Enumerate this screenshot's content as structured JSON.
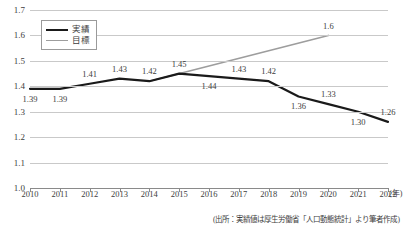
{
  "chart_data": {
    "type": "line",
    "title": "",
    "xlabel": "(年)",
    "ylabel": "",
    "x": [
      2010,
      2011,
      2012,
      2013,
      2014,
      2015,
      2016,
      2017,
      2018,
      2019,
      2020,
      2021,
      2022
    ],
    "categories": [
      "2010",
      "2011",
      "2012",
      "2013",
      "2014",
      "2015",
      "2016",
      "2017",
      "2018",
      "2019",
      "2020",
      "2021",
      "2022"
    ],
    "xlim": [
      2010,
      2022
    ],
    "ylim": [
      1.0,
      1.7
    ],
    "yticks": [
      "1.0",
      "1.1",
      "1.2",
      "1.3",
      "1.4",
      "1.5",
      "1.6",
      "1.7"
    ],
    "ytick_values": [
      1.0,
      1.1,
      1.2,
      1.3,
      1.4,
      1.5,
      1.6,
      1.7
    ],
    "grid": true,
    "legend_position": "upper-left",
    "series": [
      {
        "name": "実績",
        "color": "#1a1a1a",
        "x": [
          2010,
          2011,
          2012,
          2013,
          2014,
          2015,
          2016,
          2017,
          2018,
          2019,
          2020,
          2021,
          2022
        ],
        "values": [
          1.39,
          1.39,
          1.41,
          1.43,
          1.42,
          1.45,
          1.44,
          1.43,
          1.42,
          1.36,
          1.33,
          1.3,
          1.26
        ],
        "labels": [
          "1.39",
          "1.39",
          "1.41",
          "1.43",
          "1.42",
          "1.45",
          "1.44",
          "1.43",
          "1.42",
          "1.36",
          "1.33",
          "1.30",
          "1.26"
        ]
      },
      {
        "name": "目標",
        "color": "#9d9d9d",
        "x": [
          2014,
          2020
        ],
        "values": [
          1.42,
          1.6
        ],
        "labels": [
          "",
          "1.6"
        ]
      }
    ],
    "annotations": [
      {
        "text": "1.6",
        "x": 2020,
        "y": 1.6
      }
    ]
  },
  "legend": {
    "items": [
      {
        "label": "実績",
        "color": "#1a1a1a"
      },
      {
        "label": "目標",
        "color": "#9d9d9d"
      }
    ]
  },
  "axis": {
    "y_labels": [
      "1.7",
      "1.6",
      "1.5",
      "1.4",
      "1.3",
      "1.2",
      "1.1",
      "1.0"
    ],
    "x_labels": [
      "2010",
      "2011",
      "2012",
      "2013",
      "2014",
      "2015",
      "2016",
      "2017",
      "2018",
      "2019",
      "2020",
      "2021",
      "2022"
    ],
    "x_unit": "(年)"
  },
  "value_labels": {
    "actual": [
      "1.39",
      "1.39",
      "1.41",
      "1.43",
      "1.42",
      "1.45",
      "1.44",
      "1.43",
      "1.42",
      "1.36",
      "1.33",
      "1.30",
      "1.26"
    ],
    "target": [
      "1.6"
    ]
  },
  "source_note": "(出所：実績値は厚生労働省「人口動態統計」より筆者作成)"
}
